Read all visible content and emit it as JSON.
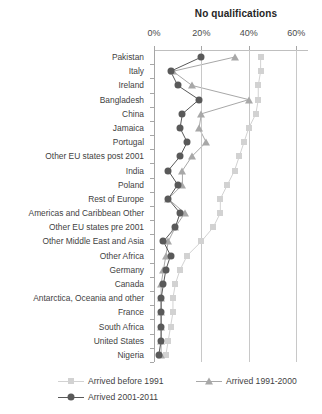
{
  "chart_data": {
    "type": "line",
    "title": "No qualifications",
    "xlabel": "",
    "ylabel": "",
    "xlim": [
      0,
      65
    ],
    "xticks": [
      0,
      20,
      40,
      60
    ],
    "xtick_labels": [
      "0%",
      "20%",
      "40%",
      "60%"
    ],
    "grid": true,
    "orientation": "horizontal-categories",
    "legend_position": "bottom",
    "categories": [
      "Pakistan",
      "Italy",
      "Ireland",
      "Bangladesh",
      "China",
      "Jamaica",
      "Portugal",
      "Other EU states post 2001",
      "India",
      "Poland",
      "Rest of Europe",
      "Americas and Caribbean Other",
      "Other EU states pre 2001",
      "Other Middle East and Asia",
      "Other Africa",
      "Germany",
      "Canada",
      "Antarctica, Oceania and other",
      "France",
      "South Africa",
      "United States",
      "Nigeria"
    ],
    "series": [
      {
        "name": "Arrived before 1991",
        "marker": "square",
        "color": "#d2d2d2",
        "values": [
          45,
          45,
          44,
          44,
          43,
          40,
          38,
          36,
          34,
          31,
          28,
          28,
          25,
          20,
          14,
          11,
          9,
          8,
          8,
          7,
          6,
          5
        ]
      },
      {
        "name": "Arrived 1991-2000",
        "marker": "triangle",
        "color": "#a8a8a8",
        "values": [
          34,
          8,
          16,
          40,
          20,
          19,
          22,
          16,
          12,
          12,
          6,
          13,
          9,
          6,
          5,
          4,
          3,
          3,
          3,
          3,
          3,
          3
        ]
      },
      {
        "name": "Arrived 2001-2011",
        "marker": "circle",
        "color": "#595959",
        "values": [
          20,
          7,
          10,
          19,
          12,
          11,
          14,
          11,
          6,
          10,
          6,
          11,
          9,
          4,
          7,
          5,
          4,
          3,
          3,
          3,
          3,
          2
        ]
      }
    ]
  },
  "legend": {
    "items": [
      {
        "label": "Arrived before 1991",
        "marker": "square"
      },
      {
        "label": "Arrived 1991-2000",
        "marker": "triangle"
      },
      {
        "label": "Arrived 2001-2011",
        "marker": "circle"
      }
    ]
  }
}
